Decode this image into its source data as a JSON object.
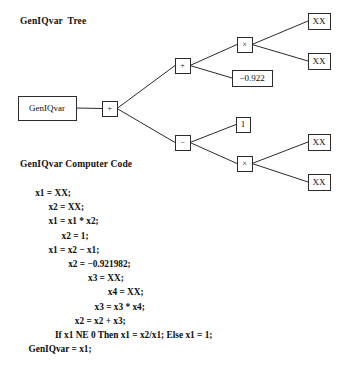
{
  "figure": {
    "tree_heading": "GenIQvar  Tree",
    "code_heading": "GenIQvar Computer Code"
  },
  "tree": {
    "nodes": [
      {
        "id": "root",
        "label": "GenIQvar",
        "kind": "variable",
        "x": 18,
        "y": 96,
        "w": 58,
        "h": 24
      },
      {
        "id": "op_plus_1",
        "label": "+",
        "kind": "operator",
        "x": 102,
        "y": 101,
        "w": 15,
        "h": 15
      },
      {
        "id": "op_plus_2",
        "label": "+",
        "kind": "operator",
        "x": 175,
        "y": 58,
        "w": 15,
        "h": 15
      },
      {
        "id": "op_mul_1",
        "label": "×",
        "kind": "operator",
        "x": 237,
        "y": 37,
        "w": 15,
        "h": 15
      },
      {
        "id": "leaf_xx_1",
        "label": "XX",
        "kind": "terminal",
        "x": 308,
        "y": 13,
        "w": 22,
        "h": 16
      },
      {
        "id": "leaf_xx_2",
        "label": "XX",
        "kind": "terminal",
        "x": 308,
        "y": 53,
        "w": 22,
        "h": 16
      },
      {
        "id": "const_a",
        "label": "−0.922",
        "kind": "constant",
        "x": 232,
        "y": 70,
        "w": 40,
        "h": 16
      },
      {
        "id": "op_minus",
        "label": "−",
        "kind": "operator",
        "x": 175,
        "y": 135,
        "w": 15,
        "h": 15
      },
      {
        "id": "const_one",
        "label": "1",
        "kind": "constant",
        "x": 236,
        "y": 117,
        "w": 14,
        "h": 15
      },
      {
        "id": "op_mul_2",
        "label": "×",
        "kind": "operator",
        "x": 237,
        "y": 156,
        "w": 15,
        "h": 15
      },
      {
        "id": "leaf_xx_3",
        "label": "XX",
        "kind": "terminal",
        "x": 308,
        "y": 134,
        "w": 22,
        "h": 16
      },
      {
        "id": "leaf_xx_4",
        "label": "XX",
        "kind": "terminal",
        "x": 308,
        "y": 174,
        "w": 22,
        "h": 16
      }
    ],
    "edges": [
      {
        "from": "root",
        "to": "op_plus_1"
      },
      {
        "from": "op_plus_1",
        "to": "op_plus_2"
      },
      {
        "from": "op_plus_1",
        "to": "op_minus"
      },
      {
        "from": "op_plus_2",
        "to": "op_mul_1"
      },
      {
        "from": "op_plus_2",
        "to": "const_a"
      },
      {
        "from": "op_mul_1",
        "to": "leaf_xx_1"
      },
      {
        "from": "op_mul_1",
        "to": "leaf_xx_2"
      },
      {
        "from": "op_minus",
        "to": "const_one"
      },
      {
        "from": "op_minus",
        "to": "op_mul_2"
      },
      {
        "from": "op_mul_2",
        "to": "leaf_xx_3"
      },
      {
        "from": "op_mul_2",
        "to": "leaf_xx_4"
      }
    ]
  },
  "code": {
    "lines": [
      {
        "indent": 2,
        "text": "x1 = XX;"
      },
      {
        "indent": 4,
        "text": "x2 = XX;"
      },
      {
        "indent": 4,
        "text": "x1 = x1 * x2;"
      },
      {
        "indent": 6,
        "text": "x2 = 1;"
      },
      {
        "indent": 4,
        "text": "x1 = x2 − x1;"
      },
      {
        "indent": 7,
        "text": "x2 = −0.921982;"
      },
      {
        "indent": 10,
        "text": "x3 = XX;"
      },
      {
        "indent": 13,
        "text": "x4 = XX;"
      },
      {
        "indent": 11,
        "text": "x3 = x3 * x4;"
      },
      {
        "indent": 8,
        "text": "x2 = x2 + x3;"
      },
      {
        "indent": 5,
        "text": "If x1 NE 0 Then x1 = x2/x1; Else x1 = 1;"
      },
      {
        "indent": 1,
        "text": "GenIQvar = x1;"
      }
    ]
  },
  "colors": {
    "stroke": "#2b2b2b",
    "text": "#0d0d0d",
    "background": "#ffffff"
  }
}
